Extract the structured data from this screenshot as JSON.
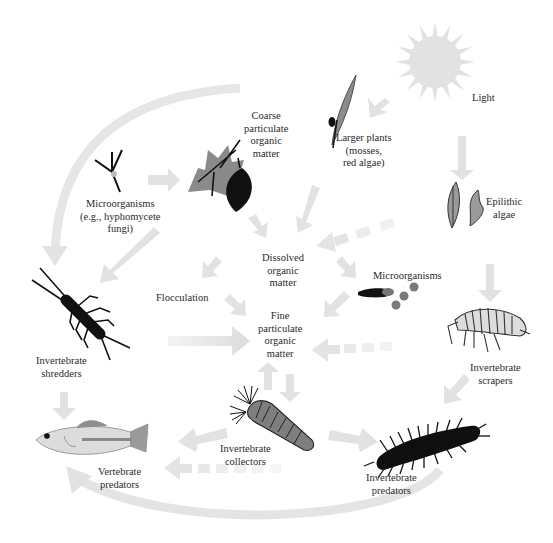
{
  "colors": {
    "arrow": "#e3e3e3",
    "arrow_light": "#efefef",
    "dark": "#0f0f0f",
    "mid_gray": "#8a8a8a",
    "light_gray": "#d6d6d6",
    "sun": "#e1e1e1",
    "text": "#2a2a2a"
  },
  "nodes": {
    "light": {
      "lines": [
        "Light"
      ],
      "icon": "sun-icon"
    },
    "larger_plants": {
      "lines": [
        "Larger plants",
        "(mosses,",
        "red algae)"
      ],
      "icon": "moss-icon"
    },
    "cpom": {
      "lines": [
        "Coarse",
        "particulate",
        "organic",
        "matter"
      ],
      "icon": "leaves-icon"
    },
    "microorganisms_fungi": {
      "lines": [
        "Microorganisms",
        "(e.g., hyphomycete",
        "fungi)"
      ],
      "icon": "hypha-icon"
    },
    "epilithic_algae": {
      "lines": [
        "Epilithic",
        "algae"
      ],
      "icon": "algae-icon"
    },
    "dom": {
      "lines": [
        "Dissolved",
        "organic",
        "matter"
      ]
    },
    "flocculation": {
      "lines": [
        "Flocculation"
      ]
    },
    "microorganisms": {
      "lines": [
        "Microorganisms"
      ],
      "icon": "bacteria-icon"
    },
    "fpom": {
      "lines": [
        "Fine",
        "particulate",
        "organic",
        "matter"
      ]
    },
    "shredders": {
      "lines": [
        "Invertebrate",
        "shredders"
      ],
      "icon": "stonefly-icon"
    },
    "scrapers": {
      "lines": [
        "Invertebrate",
        "scrapers"
      ],
      "icon": "amphipod-icon"
    },
    "collectors": {
      "lines": [
        "Invertebrate",
        "collectors"
      ],
      "icon": "blackfly-larva-icon"
    },
    "invert_predators": {
      "lines": [
        "Invertebrate",
        "predators"
      ],
      "icon": "hellgrammite-icon"
    },
    "vert_predators": {
      "lines": [
        "Vertebrate",
        "predators"
      ],
      "icon": "fish-icon"
    }
  },
  "flows": [
    {
      "from": "light",
      "to": "larger_plants",
      "style": "solid"
    },
    {
      "from": "light",
      "to": "epilithic_algae",
      "style": "solid"
    },
    {
      "from": "microorganisms_fungi",
      "to": "cpom",
      "style": "solid"
    },
    {
      "from": "larger_plants",
      "to": "dom",
      "style": "solid"
    },
    {
      "from": "cpom",
      "to": "dom",
      "style": "solid"
    },
    {
      "from": "epilithic_algae",
      "to": "dom",
      "style": "dashed"
    },
    {
      "from": "dom",
      "to": "flocculation",
      "style": "solid"
    },
    {
      "from": "dom",
      "to": "microorganisms",
      "style": "solid"
    },
    {
      "from": "flocculation",
      "to": "fpom",
      "style": "solid"
    },
    {
      "from": "microorganisms",
      "to": "fpom",
      "style": "solid"
    },
    {
      "from": "scrapers",
      "to": "fpom",
      "style": "dashed"
    },
    {
      "from": "cpom",
      "to": "shredders",
      "style": "solid"
    },
    {
      "from": "shredders",
      "to": "fpom",
      "style": "solid"
    },
    {
      "from": "fpom",
      "to": "collectors",
      "style": "solid"
    },
    {
      "from": "collectors",
      "to": "fpom",
      "style": "solid"
    },
    {
      "from": "epilithic_algae",
      "to": "scrapers",
      "style": "solid"
    },
    {
      "from": "scrapers",
      "to": "invert_predators",
      "style": "solid"
    },
    {
      "from": "collectors",
      "to": "invert_predators",
      "style": "solid"
    },
    {
      "from": "collectors",
      "to": "vert_predators",
      "style": "solid"
    },
    {
      "from": "shredders",
      "to": "vert_predators",
      "style": "solid"
    },
    {
      "from": "invert_predators",
      "to": "vert_predators",
      "style": "dashed"
    },
    {
      "from": "invert_predators",
      "to": "vert_predators",
      "style": "curved"
    },
    {
      "from": "cpom",
      "to": "shredders",
      "style": "curved"
    }
  ]
}
